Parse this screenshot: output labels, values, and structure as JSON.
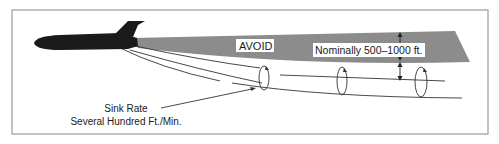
{
  "diagram": {
    "labels": {
      "avoid": "AVOID",
      "separation": "Nominally 500–1000 ft.",
      "sink_rate_line1": "Sink Rate",
      "sink_rate_line2": "Several Hundred Ft./Min."
    },
    "elements": {
      "aircraft": "jet-aircraft-silhouette",
      "avoid_zone": "shaded-wake-region",
      "vortices": [
        "wingtip-vortex-1",
        "wingtip-vortex-2",
        "wingtip-vortex-3"
      ],
      "separation_arrow": "vertical-double-arrow"
    },
    "colors": {
      "avoid_zone": "#8c8c8c",
      "aircraft": "#1a1a1a",
      "frame": "#9a9a9a",
      "lines": "#333333"
    }
  }
}
